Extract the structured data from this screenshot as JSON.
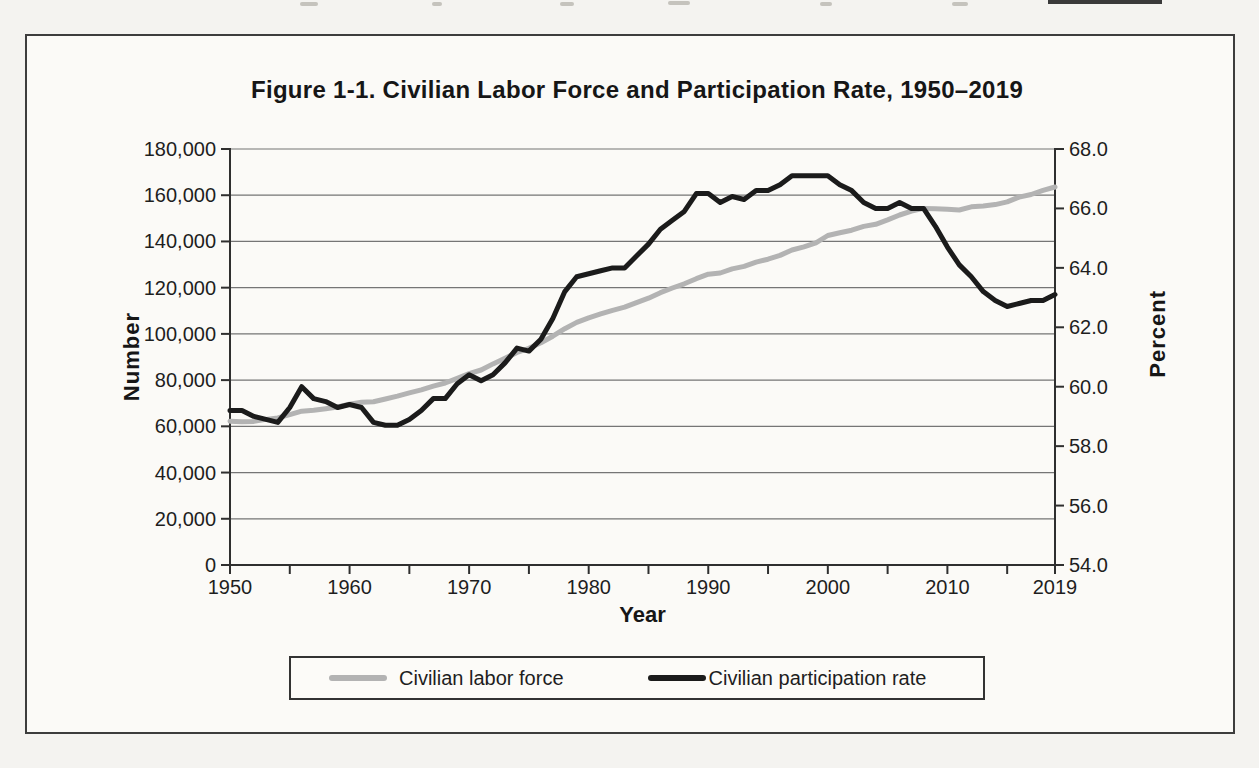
{
  "title": "Figure 1-1. Civilian Labor Force and Participation Rate, 1950–2019",
  "axes": {
    "left": {
      "label": "Number",
      "tick_labels": [
        "180,000",
        "160,000",
        "140,000",
        "120,000",
        "100,000",
        "80,000",
        "60,000",
        "40,000",
        "20,000",
        "0"
      ]
    },
    "right": {
      "label": "Percent",
      "tick_labels": [
        "68.0",
        "66.0",
        "64.0",
        "62.0",
        "60.0",
        "58.0",
        "56.0",
        "54.0"
      ]
    },
    "x": {
      "label": "Year",
      "tick_labels": [
        "1950",
        "1960",
        "1970",
        "1980",
        "1990",
        "2000",
        "2010",
        "2019"
      ],
      "minor_tick_step": 5
    }
  },
  "legend": [
    {
      "label": "Civilian labor force",
      "color": "#b3b3b3"
    },
    {
      "label": "Civilian participation rate",
      "color": "#1b1b1b"
    }
  ],
  "chart_data": {
    "type": "line",
    "title": "Figure 1-1. Civilian Labor Force and Participation Rate, 1950–2019",
    "xlabel": "Year",
    "ylabel_left": "Number",
    "ylabel_right": "Percent",
    "left_ylim": [
      0,
      180000
    ],
    "right_ylim": [
      54.0,
      68.0
    ],
    "xlim": [
      1950,
      2019
    ],
    "grid": "horizontal",
    "legend_position": "bottom",
    "x": [
      1950,
      1951,
      1952,
      1953,
      1954,
      1955,
      1956,
      1957,
      1958,
      1959,
      1960,
      1961,
      1962,
      1963,
      1964,
      1965,
      1966,
      1967,
      1968,
      1969,
      1970,
      1971,
      1972,
      1973,
      1974,
      1975,
      1976,
      1977,
      1978,
      1979,
      1980,
      1981,
      1982,
      1983,
      1984,
      1985,
      1986,
      1987,
      1988,
      1989,
      1990,
      1991,
      1992,
      1993,
      1994,
      1995,
      1996,
      1997,
      1998,
      1999,
      2000,
      2001,
      2002,
      2003,
      2004,
      2005,
      2006,
      2007,
      2008,
      2009,
      2010,
      2011,
      2012,
      2013,
      2014,
      2015,
      2016,
      2017,
      2018,
      2019
    ],
    "series": [
      {
        "name": "Civilian labor force",
        "axis": "left",
        "units": "thousands",
        "color": "#b3b3b3",
        "values": [
          62208,
          62017,
          62138,
          63015,
          63643,
          65023,
          66552,
          66929,
          67639,
          68369,
          69628,
          70459,
          70614,
          71833,
          73091,
          74455,
          75770,
          77347,
          78737,
          80734,
          82771,
          84382,
          87034,
          89429,
          91949,
          93775,
          96158,
          99009,
          102251,
          104962,
          106940,
          108670,
          110204,
          111550,
          113544,
          115461,
          117834,
          119865,
          121669,
          123869,
          125840,
          126346,
          128105,
          129200,
          131056,
          132304,
          133943,
          136297,
          137673,
          139368,
          142583,
          143734,
          144863,
          146510,
          147401,
          149320,
          151428,
          153124,
          154287,
          154142,
          153889,
          153617,
          154975,
          155389,
          155922,
          157130,
          159187,
          160320,
          162075,
          163539
        ]
      },
      {
        "name": "Civilian participation rate",
        "axis": "right",
        "units": "percent",
        "color": "#1b1b1b",
        "values": [
          59.2,
          59.2,
          59.0,
          58.9,
          58.8,
          59.3,
          60.0,
          59.6,
          59.5,
          59.3,
          59.4,
          59.3,
          58.8,
          58.7,
          58.7,
          58.9,
          59.2,
          59.6,
          59.6,
          60.1,
          60.4,
          60.2,
          60.4,
          60.8,
          61.3,
          61.2,
          61.6,
          62.3,
          63.2,
          63.7,
          63.8,
          63.9,
          64.0,
          64.0,
          64.4,
          64.8,
          65.3,
          65.6,
          65.9,
          66.5,
          66.5,
          66.2,
          66.4,
          66.3,
          66.6,
          66.6,
          66.8,
          67.1,
          67.1,
          67.1,
          67.1,
          66.8,
          66.6,
          66.2,
          66.0,
          66.0,
          66.2,
          66.0,
          66.0,
          65.4,
          64.7,
          64.1,
          63.7,
          63.2,
          62.9,
          62.7,
          62.8,
          62.9,
          62.9,
          63.1
        ]
      }
    ]
  },
  "style": {
    "gridline_color": "#757575",
    "axis_color": "#2f2f2f",
    "figure_border_color": "#3d3d3d"
  }
}
